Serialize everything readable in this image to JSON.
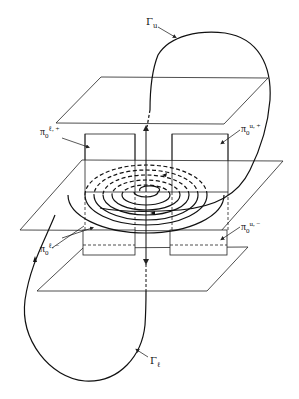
{
  "figure": {
    "stroke_color": "#222222",
    "background": "#ffffff"
  },
  "labels": {
    "gamma_u": {
      "base": "Γ",
      "sub": "u"
    },
    "gamma_l": {
      "base": "Γ",
      "sub": "ℓ"
    },
    "pi_l_plus": {
      "base": "π",
      "sub": "0",
      "sup": "ℓ, +"
    },
    "pi_u_plus": {
      "base": "π",
      "sub": "0",
      "sup": "u, +"
    },
    "pi_u_minus": {
      "base": "π",
      "sub": "0",
      "sup": "u, −"
    },
    "pi_l_minus": {
      "base": "π",
      "sub": "0",
      "sup": "ℓ, −"
    }
  },
  "planes": [
    {
      "name": "top-plane",
      "points": [
        [
          101,
          77
        ],
        [
          268,
          78
        ],
        [
          224,
          124
        ],
        [
          56,
          123
        ]
      ]
    },
    {
      "name": "middle-plane",
      "points": [
        [
          82,
          160
        ],
        [
          283,
          161
        ],
        [
          221,
          231
        ],
        [
          20,
          230
        ]
      ]
    },
    {
      "name": "bottom-plane",
      "points": [
        [
          83,
          248
        ],
        [
          248,
          247
        ],
        [
          207,
          291
        ],
        [
          37,
          291
        ]
      ]
    }
  ],
  "boxes": [
    {
      "name": "box-upper-left",
      "x": 85,
      "y": 134,
      "w": 50,
      "h": 58
    },
    {
      "name": "box-upper-right",
      "x": 172,
      "y": 134,
      "w": 56,
      "h": 58
    },
    {
      "name": "box-lower-left",
      "x": 83,
      "y": 230,
      "w": 52,
      "h": 25
    },
    {
      "name": "box-lower-right",
      "x": 170,
      "y": 230,
      "w": 57,
      "h": 25
    }
  ]
}
